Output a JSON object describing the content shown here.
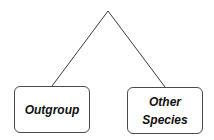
{
  "diagram": {
    "type": "phylogenetic-tree",
    "line_color": "#3a3a3a",
    "nodes": [
      {
        "id": "outgroup",
        "label_lines": [
          "Outgroup"
        ]
      },
      {
        "id": "other-species",
        "label_lines": [
          "Other",
          "Species"
        ]
      }
    ],
    "edges": [
      {
        "from": "root",
        "to": "outgroup"
      },
      {
        "from": "root",
        "to": "other-species"
      }
    ]
  }
}
